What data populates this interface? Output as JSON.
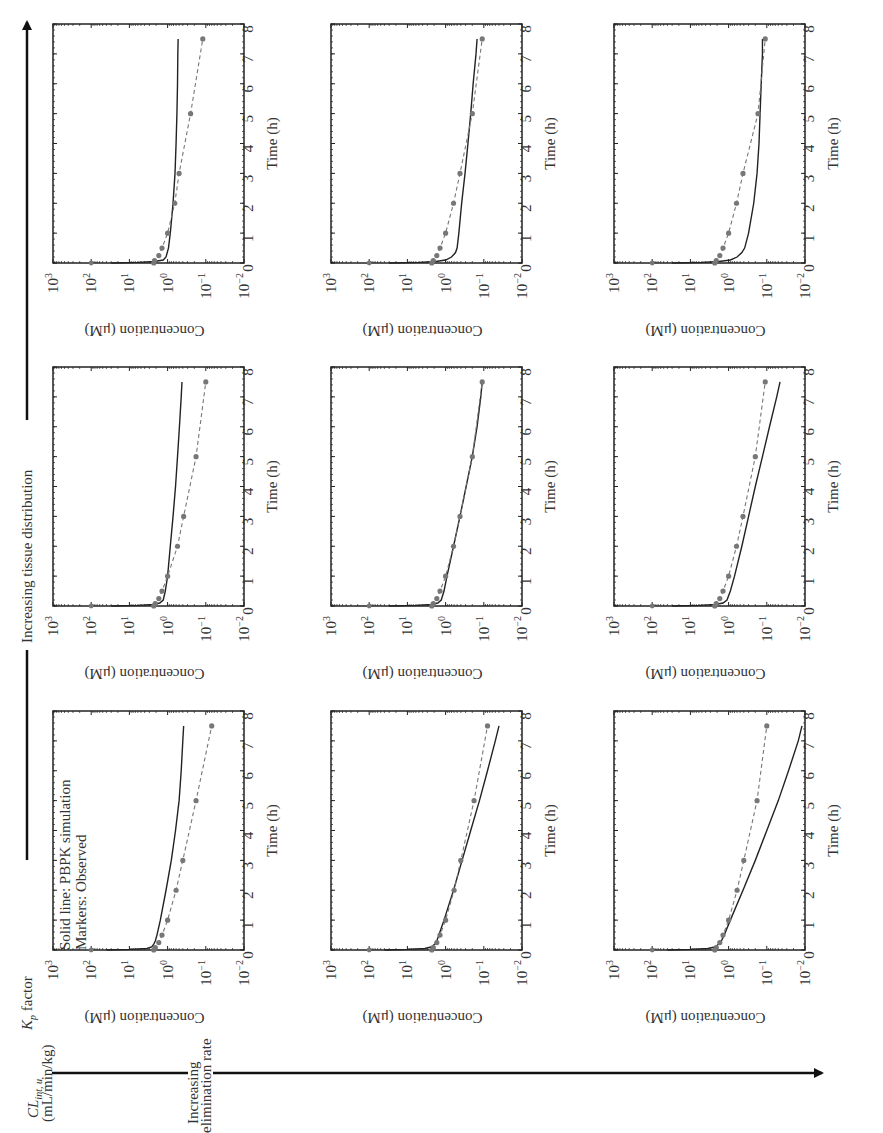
{
  "figure": {
    "orientation": "rotated-90-ccw",
    "row_axis_label": "K_p factor",
    "row_axis_label_main": "K",
    "row_axis_label_sub": "p",
    "row_axis_label_rest": " factor",
    "row_axis_direction_label": "Increasing tissue distribution",
    "col_axis_label_line1_main": "CL",
    "col_axis_label_line1_sub": "int, u",
    "col_axis_label_line2": "(mL/min/kg)",
    "col_axis_direction_label_line1": "Increasing",
    "col_axis_direction_label_line2": "elimination rate",
    "legend_line1": "Solid line: PBPK simulation",
    "legend_line2": "Markers: Observed",
    "colors": {
      "simulation": "#222222",
      "observed": "#777777",
      "frame": "#222222"
    }
  },
  "chart_data": [
    {
      "type": "line",
      "panel": "CL low / Kp high",
      "xlabel": "Time (h)",
      "ylabel": "Concentration (μM)",
      "yscale": "log",
      "xlim": [
        0,
        8
      ],
      "ylim": [
        0.01,
        1000
      ],
      "xticks": [
        "0",
        "1",
        "2",
        "3",
        "4",
        "5",
        "6",
        "7",
        "8"
      ],
      "yticks": [
        "10^3",
        "10^2",
        "10^1",
        "10^0",
        "10^-1",
        "10^-2"
      ],
      "series": [
        {
          "name": "PBPK simulation",
          "style": "solid",
          "x": [
            0,
            0.02,
            0.05,
            0.1,
            0.2,
            0.5,
            1,
            2,
            3,
            4,
            5,
            6,
            7,
            7.5
          ],
          "y": [
            30,
            6,
            2.2,
            1.3,
            1.1,
            0.95,
            0.85,
            0.72,
            0.64,
            0.6,
            0.57,
            0.55,
            0.54,
            0.53
          ]
        },
        {
          "name": "Observed",
          "style": "dashed-markers",
          "x": [
            0,
            0.083,
            0.25,
            0.5,
            1,
            2,
            3,
            5,
            7.5
          ],
          "y": [
            2.3,
            2.2,
            1.7,
            1.4,
            1.0,
            0.65,
            0.5,
            0.25,
            0.12
          ]
        }
      ]
    },
    {
      "type": "line",
      "panel": "CL medium / Kp high",
      "xlabel": "Time (h)",
      "ylabel": "Concentration (μM)",
      "yscale": "log",
      "xlim": [
        0,
        8
      ],
      "ylim": [
        0.01,
        1000
      ],
      "xticks": [
        "0",
        "1",
        "2",
        "3",
        "4",
        "5",
        "6",
        "7",
        "8"
      ],
      "yticks": [
        "10^3",
        "10^2",
        "10^1",
        "10^0",
        "10^-1",
        "10^-2"
      ],
      "series": [
        {
          "name": "PBPK simulation",
          "style": "solid",
          "x": [
            0,
            0.02,
            0.05,
            0.1,
            0.2,
            0.35,
            0.5,
            1,
            2,
            3,
            4,
            5,
            6,
            7,
            7.5
          ],
          "y": [
            30,
            5,
            1.8,
            1.0,
            0.7,
            0.55,
            0.5,
            0.45,
            0.38,
            0.31,
            0.26,
            0.22,
            0.19,
            0.16,
            0.15
          ]
        },
        {
          "name": "Observed",
          "style": "dashed-markers",
          "x": [
            0,
            0.083,
            0.25,
            0.5,
            1,
            2,
            3,
            5,
            7.5
          ],
          "y": [
            2.3,
            2.1,
            1.7,
            1.4,
            1.0,
            0.62,
            0.42,
            0.2,
            0.11
          ]
        }
      ]
    },
    {
      "type": "line",
      "panel": "CL high / Kp high",
      "xlabel": "Time (h)",
      "ylabel": "Concentration (μM)",
      "yscale": "log",
      "xlim": [
        0,
        8
      ],
      "ylim": [
        0.01,
        1000
      ],
      "xticks": [
        "0",
        "1",
        "2",
        "3",
        "4",
        "5",
        "6",
        "7",
        "8"
      ],
      "yticks": [
        "10^3",
        "10^2",
        "10^1",
        "10^0",
        "10^-1",
        "10^-2"
      ],
      "series": [
        {
          "name": "PBPK simulation",
          "style": "solid",
          "x": [
            0,
            0.02,
            0.05,
            0.1,
            0.2,
            0.35,
            0.5,
            1,
            2,
            3,
            4,
            5,
            6,
            7,
            7.5
          ],
          "y": [
            30,
            5,
            1.8,
            0.9,
            0.6,
            0.45,
            0.38,
            0.3,
            0.22,
            0.18,
            0.16,
            0.15,
            0.14,
            0.13,
            0.13
          ]
        },
        {
          "name": "Observed",
          "style": "dashed-markers",
          "x": [
            0,
            0.083,
            0.25,
            0.5,
            1,
            2,
            3,
            5,
            7.5
          ],
          "y": [
            2.3,
            2.1,
            1.7,
            1.4,
            1.0,
            0.62,
            0.42,
            0.17,
            0.11
          ]
        }
      ]
    },
    {
      "type": "line",
      "panel": "CL low / Kp medium",
      "xlabel": "Time (h)",
      "ylabel": "Concentration (μM)",
      "yscale": "log",
      "xlim": [
        0,
        8
      ],
      "ylim": [
        0.01,
        1000
      ],
      "xticks": [
        "0",
        "1",
        "2",
        "3",
        "4",
        "5",
        "6",
        "7",
        "8"
      ],
      "yticks": [
        "10^3",
        "10^2",
        "10^1",
        "10^0",
        "10^-1",
        "10^-2"
      ],
      "series": [
        {
          "name": "PBPK simulation",
          "style": "solid",
          "x": [
            0,
            0.02,
            0.05,
            0.1,
            0.2,
            0.5,
            1,
            2,
            3,
            4,
            5,
            6,
            7,
            7.5
          ],
          "y": [
            30,
            6,
            2.5,
            1.6,
            1.3,
            1.15,
            1.0,
            0.85,
            0.72,
            0.62,
            0.55,
            0.49,
            0.44,
            0.42
          ]
        },
        {
          "name": "Observed",
          "style": "dashed-markers",
          "x": [
            0,
            0.083,
            0.25,
            0.5,
            1,
            2,
            3,
            5,
            7.5
          ],
          "y": [
            2.3,
            2.1,
            1.7,
            1.4,
            1.0,
            0.55,
            0.38,
            0.18,
            0.1
          ]
        }
      ]
    },
    {
      "type": "line",
      "panel": "CL medium / Kp medium",
      "xlabel": "Time (h)",
      "ylabel": "Concentration (μM)",
      "yscale": "log",
      "xlim": [
        0,
        8
      ],
      "ylim": [
        0.01,
        1000
      ],
      "xticks": [
        "0",
        "1",
        "2",
        "3",
        "4",
        "5",
        "6",
        "7",
        "8"
      ],
      "yticks": [
        "10^3",
        "10^2",
        "10^1",
        "10^0",
        "10^-1",
        "10^-2"
      ],
      "series": [
        {
          "name": "PBPK simulation",
          "style": "solid",
          "x": [
            0,
            0.02,
            0.05,
            0.1,
            0.2,
            0.5,
            1,
            2,
            3,
            4,
            5,
            6,
            7,
            7.5
          ],
          "y": [
            30,
            6,
            2.4,
            1.6,
            1.3,
            1.1,
            0.92,
            0.62,
            0.42,
            0.29,
            0.2,
            0.15,
            0.12,
            0.11
          ]
        },
        {
          "name": "Observed",
          "style": "dashed-markers",
          "x": [
            0,
            0.083,
            0.25,
            0.5,
            1,
            2,
            3,
            5,
            7.5
          ],
          "y": [
            2.3,
            2.1,
            1.7,
            1.4,
            1.0,
            0.62,
            0.42,
            0.2,
            0.11
          ]
        }
      ]
    },
    {
      "type": "line",
      "panel": "CL high / Kp medium",
      "xlabel": "Time (h)",
      "ylabel": "Concentration (μM)",
      "yscale": "log",
      "xlim": [
        0,
        8
      ],
      "ylim": [
        0.01,
        1000
      ],
      "xticks": [
        "0",
        "1",
        "2",
        "3",
        "4",
        "5",
        "6",
        "7",
        "8"
      ],
      "yticks": [
        "10^3",
        "10^2",
        "10^1",
        "10^0",
        "10^-1",
        "10^-2"
      ],
      "series": [
        {
          "name": "PBPK simulation",
          "style": "solid",
          "x": [
            0,
            0.02,
            0.05,
            0.1,
            0.2,
            0.5,
            1,
            2,
            3,
            4,
            5,
            6,
            7,
            7.5
          ],
          "y": [
            30,
            6,
            2.2,
            1.4,
            1.1,
            0.9,
            0.7,
            0.45,
            0.3,
            0.2,
            0.13,
            0.085,
            0.055,
            0.045
          ]
        },
        {
          "name": "Observed",
          "style": "dashed-markers",
          "x": [
            0,
            0.083,
            0.25,
            0.5,
            1,
            2,
            3,
            5,
            7.5
          ],
          "y": [
            2.3,
            2.1,
            1.7,
            1.4,
            1.0,
            0.62,
            0.42,
            0.2,
            0.11
          ]
        }
      ]
    },
    {
      "type": "line",
      "panel": "CL low / Kp low",
      "xlabel": "Time (h)",
      "ylabel": "Concentration (μM)",
      "yscale": "log",
      "xlim": [
        0,
        8
      ],
      "ylim": [
        0.01,
        1000
      ],
      "xticks": [
        "0",
        "1",
        "2",
        "3",
        "4",
        "5",
        "6",
        "7",
        "8"
      ],
      "yticks": [
        "10^3",
        "10^2",
        "10^1",
        "10^0",
        "10^-1",
        "10^-2"
      ],
      "series": [
        {
          "name": "PBPK simulation",
          "style": "solid",
          "x": [
            0,
            0.02,
            0.05,
            0.1,
            0.2,
            0.3,
            0.5,
            1,
            2,
            3,
            4,
            5,
            6,
            7,
            7.5
          ],
          "y": [
            40,
            10,
            3.5,
            2.6,
            2.3,
            2.1,
            1.9,
            1.55,
            1.1,
            0.8,
            0.62,
            0.5,
            0.44,
            0.4,
            0.38
          ]
        },
        {
          "name": "Observed",
          "style": "dashed-markers",
          "x": [
            0,
            0.083,
            0.25,
            0.5,
            1,
            2,
            3,
            5,
            7.5
          ],
          "y": [
            2.3,
            2.1,
            1.7,
            1.4,
            1.0,
            0.6,
            0.4,
            0.18,
            0.07
          ]
        }
      ]
    },
    {
      "type": "line",
      "panel": "CL medium / Kp low",
      "xlabel": "Time (h)",
      "ylabel": "Concentration (μM)",
      "yscale": "log",
      "xlim": [
        0,
        8
      ],
      "ylim": [
        0.01,
        1000
      ],
      "xticks": [
        "0",
        "1",
        "2",
        "3",
        "4",
        "5",
        "6",
        "7",
        "8"
      ],
      "yticks": [
        "10^3",
        "10^2",
        "10^1",
        "10^0",
        "10^-1",
        "10^-2"
      ],
      "series": [
        {
          "name": "PBPK simulation",
          "style": "solid",
          "x": [
            0,
            0.02,
            0.05,
            0.1,
            0.2,
            0.3,
            0.5,
            1,
            2,
            3,
            4,
            5,
            6,
            7,
            7.5
          ],
          "y": [
            40,
            10,
            3.5,
            2.4,
            1.9,
            1.7,
            1.5,
            1.1,
            0.62,
            0.37,
            0.22,
            0.13,
            0.08,
            0.05,
            0.04
          ]
        },
        {
          "name": "Observed",
          "style": "dashed-markers",
          "x": [
            0,
            0.083,
            0.25,
            0.5,
            1,
            2,
            3,
            5,
            7.5
          ],
          "y": [
            2.3,
            2.1,
            1.7,
            1.4,
            1.0,
            0.6,
            0.4,
            0.18,
            0.08
          ]
        }
      ]
    },
    {
      "type": "line",
      "panel": "CL high / Kp low",
      "xlabel": "Time (h)",
      "ylabel": "Concentration (μM)",
      "yscale": "log",
      "xlim": [
        0,
        8
      ],
      "ylim": [
        0.01,
        1000
      ],
      "xticks": [
        "0",
        "1",
        "2",
        "3",
        "4",
        "5",
        "6",
        "7",
        "8"
      ],
      "yticks": [
        "10^3",
        "10^2",
        "10^1",
        "10^0",
        "10^-1",
        "10^-2"
      ],
      "series": [
        {
          "name": "PBPK simulation",
          "style": "solid",
          "x": [
            0,
            0.02,
            0.05,
            0.1,
            0.2,
            0.3,
            0.5,
            1,
            2,
            3,
            4,
            5,
            6,
            7,
            7.5
          ],
          "y": [
            40,
            10,
            3.5,
            2.3,
            1.8,
            1.55,
            1.3,
            0.9,
            0.42,
            0.2,
            0.1,
            0.05,
            0.027,
            0.015,
            0.012
          ]
        },
        {
          "name": "Observed",
          "style": "dashed-markers",
          "x": [
            0,
            0.083,
            0.25,
            0.5,
            1,
            2,
            3,
            5,
            7.5
          ],
          "y": [
            2.3,
            2.1,
            1.7,
            1.4,
            1.0,
            0.6,
            0.4,
            0.18,
            0.1
          ]
        }
      ]
    }
  ]
}
